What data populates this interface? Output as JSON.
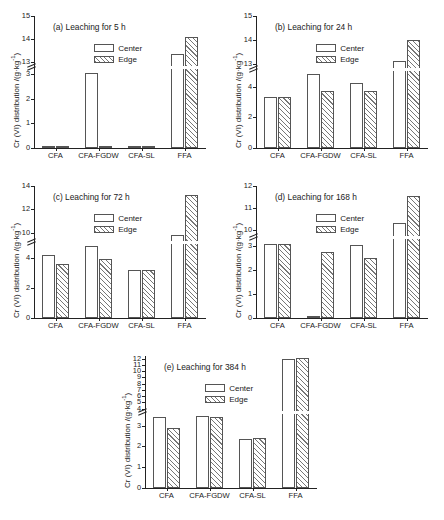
{
  "figure": {
    "ylabel": "Cr (VI) distribution /(g·kg",
    "ylabel_sup": "-1",
    "ylabel_tail": ")",
    "categories": [
      "CFA",
      "CFA-FGDW",
      "CFA-SL",
      "FFA"
    ],
    "legend": {
      "center": "Center",
      "edge": "Edge"
    },
    "caption": ""
  },
  "chart_data": [
    {
      "type": "bar",
      "panel": "a",
      "title": "(a) Leaching for 5 h",
      "categories": [
        "CFA",
        "CFA-FGDW",
        "CFA-SL",
        "FFA"
      ],
      "series": [
        {
          "name": "Center",
          "values": [
            3.5,
            3.05,
            3.6,
            13.35
          ]
        },
        {
          "name": "Edge",
          "values": [
            3.85,
            3.4,
            3.85,
            14.1
          ]
        }
      ],
      "xlabel": "",
      "ylabel": "Cr (VI) distribution /(g·kg-1)",
      "axis_break": true,
      "ylim_lower": [
        0,
        3.2
      ],
      "ylim_upper": [
        12.85,
        15
      ],
      "ticks_lower": [
        0,
        1,
        2,
        3
      ],
      "ticks_upper": [
        13,
        14,
        15
      ],
      "grid": false,
      "legend_position": "upper-center"
    },
    {
      "type": "bar",
      "panel": "b",
      "title": "(b) Leaching for 24 h",
      "categories": [
        "CFA",
        "CFA-FGDW",
        "CFA-SL",
        "FFA"
      ],
      "series": [
        {
          "name": "Center",
          "values": [
            3.35,
            4.85,
            4.25,
            13.1
          ]
        },
        {
          "name": "Edge",
          "values": [
            3.35,
            3.75,
            3.7,
            14.0
          ]
        }
      ],
      "xlabel": "",
      "ylabel": "Cr(VI) distribution /(g·kg-1)",
      "axis_break": true,
      "ylim_lower": [
        0,
        5.0
      ],
      "ylim_upper": [
        12.8,
        15
      ],
      "ticks_lower": [
        0,
        2,
        4
      ],
      "ticks_upper": [
        13,
        14,
        15
      ],
      "grid": false,
      "legend_position": "upper-center"
    },
    {
      "type": "bar",
      "panel": "c",
      "title": "(c) Leaching for 72 h",
      "categories": [
        "CFA",
        "CFA-FGDW",
        "CFA-SL",
        "FFA"
      ],
      "series": [
        {
          "name": "Center",
          "values": [
            4.15,
            4.75,
            3.15,
            9.8
          ]
        },
        {
          "name": "Edge",
          "values": [
            3.6,
            3.9,
            3.2,
            13.2
          ]
        }
      ],
      "xlabel": "",
      "ylabel": "Cr (VI) distribution /(g·kg-1)",
      "axis_break": true,
      "ylim_lower": [
        0,
        4.9
      ],
      "ylim_upper": [
        9.3,
        14
      ],
      "ticks_lower": [
        0,
        2,
        4
      ],
      "ticks_upper": [
        10,
        12,
        14
      ],
      "grid": false,
      "legend_position": "upper-center"
    },
    {
      "type": "bar",
      "panel": "d",
      "title": "(d) Leaching for 168 h",
      "categories": [
        "CFA",
        "CFA-FGDW",
        "CFA-SL",
        "FFA"
      ],
      "series": [
        {
          "name": "Center",
          "values": [
            3.1,
            3.75,
            3.05,
            10.35
          ]
        },
        {
          "name": "Edge",
          "values": [
            3.1,
            2.75,
            2.5,
            11.55
          ]
        }
      ],
      "xlabel": "",
      "ylabel": "Cr (VI) distribution /(g·kg-1)",
      "axis_break": true,
      "ylim_lower": [
        0,
        3.3
      ],
      "ylim_upper": [
        9.75,
        12
      ],
      "ticks_lower": [
        0,
        1,
        2,
        3
      ],
      "ticks_upper": [
        10,
        11,
        12
      ],
      "grid": false,
      "legend_position": "upper-center"
    },
    {
      "type": "bar",
      "panel": "e",
      "title": "(e) Leaching for 384 h",
      "categories": [
        "CFA",
        "CFA-FGDW",
        "CFA-SL",
        "FFA"
      ],
      "series": [
        {
          "name": "Center",
          "values": [
            3.4,
            3.45,
            2.35,
            11.9
          ]
        },
        {
          "name": "Edge",
          "values": [
            2.9,
            3.4,
            2.4,
            12.1
          ]
        }
      ],
      "xlabel": "",
      "ylabel": "Cr (VI) distribution /(g·kg-1)",
      "axis_break": true,
      "ylim_lower": [
        0,
        3.55
      ],
      "ylim_upper": [
        3.6,
        12.4
      ],
      "ticks_lower": [
        0,
        1,
        2,
        3
      ],
      "ticks_upper": [
        4,
        5,
        6,
        7,
        8,
        9,
        10,
        11,
        12
      ],
      "grid": false,
      "legend_position": "upper-center"
    }
  ]
}
